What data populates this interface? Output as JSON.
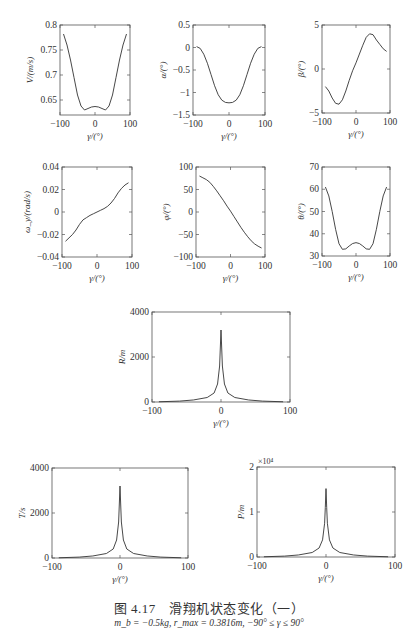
{
  "header": {
    "text": "|  |  |  ..."
  },
  "caption": {
    "title": "图 4.17　滑翔机状态变化（一）",
    "subtitle": "m_b = −0.5kg, r_max = 0.3816m, −90° ≤ γ ≤ 90°"
  },
  "chart_data": [
    {
      "id": "V",
      "type": "line",
      "title": "",
      "xlabel": "γ/(°)",
      "ylabel": "V/(m/s)",
      "xlim": [
        -100,
        100
      ],
      "ylim": [
        0.62,
        0.8
      ],
      "xticks": [
        "-100",
        "0",
        "100"
      ],
      "yticks": [
        "0.65",
        "0.7",
        "0.75",
        "0.8"
      ],
      "box": [
        60,
        25,
        130,
        115
      ],
      "x": [
        -90,
        -80,
        -70,
        -60,
        -50,
        -40,
        -30,
        -20,
        -10,
        0,
        10,
        20,
        30,
        40,
        50,
        60,
        70,
        80,
        90
      ],
      "y": [
        0.782,
        0.76,
        0.73,
        0.695,
        0.66,
        0.638,
        0.63,
        0.633,
        0.636,
        0.637,
        0.636,
        0.633,
        0.63,
        0.638,
        0.66,
        0.695,
        0.73,
        0.76,
        0.782
      ]
    },
    {
      "id": "alpha",
      "type": "line",
      "title": "",
      "xlabel": "γ/(°)",
      "ylabel": "α/(°)",
      "xlim": [
        -100,
        100
      ],
      "ylim": [
        -1.5,
        0.5
      ],
      "xticks": [
        "-100",
        "0",
        "100"
      ],
      "yticks": [
        "-1.5",
        "-1",
        "-0.5",
        "0",
        "0.5"
      ],
      "box": [
        193,
        25,
        265,
        115
      ],
      "x": [
        -90,
        -80,
        -70,
        -60,
        -50,
        -40,
        -30,
        -20,
        -10,
        0,
        10,
        20,
        30,
        40,
        50,
        60,
        70,
        80,
        90
      ],
      "y": [
        0.02,
        -0.02,
        -0.15,
        -0.35,
        -0.6,
        -0.85,
        -1.05,
        -1.17,
        -1.22,
        -1.23,
        -1.22,
        -1.17,
        -1.05,
        -0.85,
        -0.6,
        -0.35,
        -0.15,
        -0.02,
        0.02
      ]
    },
    {
      "id": "beta",
      "type": "line",
      "title": "",
      "xlabel": "γ/(°)",
      "ylabel": "β/(°)",
      "xlim": [
        -100,
        100
      ],
      "ylim": [
        -5,
        5
      ],
      "xticks": [
        "-100",
        "0",
        "100"
      ],
      "yticks": [
        "-5",
        "0",
        "5"
      ],
      "box": [
        322,
        25,
        390,
        113
      ],
      "x": [
        -90,
        -80,
        -70,
        -60,
        -50,
        -40,
        -30,
        -20,
        -10,
        0,
        10,
        20,
        30,
        40,
        50,
        60,
        70,
        80,
        90
      ],
      "y": [
        -2.0,
        -2.5,
        -3.3,
        -3.9,
        -4.0,
        -3.5,
        -2.5,
        -1.3,
        -0.2,
        0.7,
        1.7,
        2.7,
        3.6,
        4.0,
        3.9,
        3.3,
        2.8,
        2.3,
        2.0
      ]
    },
    {
      "id": "omega_y",
      "type": "line",
      "title": "",
      "xlabel": "γ/(°)",
      "ylabel": "ω_y/(rad/s)",
      "xlim": [
        -100,
        100
      ],
      "ylim": [
        -0.04,
        0.04
      ],
      "xticks": [
        "-100",
        "0",
        "100"
      ],
      "yticks": [
        "-0.04",
        "-0.02",
        "0",
        "0.02",
        "0.04"
      ],
      "box": [
        62,
        167,
        132,
        257
      ],
      "x": [
        -90,
        -80,
        -70,
        -60,
        -50,
        -40,
        -30,
        -20,
        -10,
        0,
        10,
        20,
        30,
        40,
        50,
        60,
        70,
        80,
        90
      ],
      "y": [
        -0.026,
        -0.023,
        -0.02,
        -0.016,
        -0.011,
        -0.007,
        -0.005,
        -0.003,
        -0.0015,
        0,
        0.0015,
        0.003,
        0.005,
        0.008,
        0.012,
        0.017,
        0.021,
        0.024,
        0.026
      ]
    },
    {
      "id": "phi",
      "type": "line",
      "title": "",
      "xlabel": "γ/(°)",
      "ylabel": "φ/(°)",
      "xlim": [
        -100,
        100
      ],
      "ylim": [
        -100,
        100
      ],
      "xticks": [
        "-100",
        "0",
        "100"
      ],
      "yticks": [
        "-100",
        "-50",
        "0",
        "50",
        "100"
      ],
      "box": [
        196,
        167,
        265,
        257
      ],
      "x": [
        -90,
        -80,
        -70,
        -60,
        -50,
        -40,
        -30,
        -20,
        -10,
        0,
        10,
        20,
        30,
        40,
        50,
        60,
        70,
        80,
        90
      ],
      "y": [
        80,
        76,
        72,
        66,
        57,
        47,
        36,
        25,
        13,
        2,
        -10,
        -22,
        -34,
        -45,
        -55,
        -64,
        -71,
        -76,
        -80
      ]
    },
    {
      "id": "theta",
      "type": "line",
      "title": "",
      "xlabel": "γ/(°)",
      "ylabel": "θ/(°)",
      "xlim": [
        -100,
        100
      ],
      "ylim": [
        30,
        70
      ],
      "xticks": [
        "-100",
        "0",
        "100"
      ],
      "yticks": [
        "30",
        "40",
        "50",
        "60",
        "70"
      ],
      "box": [
        322,
        167,
        390,
        256
      ],
      "x": [
        -90,
        -80,
        -70,
        -60,
        -50,
        -40,
        -30,
        -20,
        -10,
        0,
        10,
        20,
        30,
        40,
        50,
        60,
        70,
        80,
        90
      ],
      "y": [
        61,
        57,
        50,
        42,
        35.5,
        33,
        33.2,
        34.5,
        35.6,
        36,
        35.6,
        34.5,
        33.2,
        33,
        35.5,
        42,
        50,
        57,
        61
      ]
    },
    {
      "id": "R",
      "type": "line",
      "title": "",
      "xlabel": "γ/(°)",
      "ylabel": "R/m",
      "xlim": [
        -100,
        100
      ],
      "ylim": [
        0,
        4000
      ],
      "xticks": [
        "-100",
        "0",
        "100"
      ],
      "yticks": [
        "0",
        "2000",
        "4000"
      ],
      "box": [
        152,
        312,
        290,
        402
      ],
      "x": [
        -90,
        -60,
        -40,
        -20,
        -10,
        -5,
        -2,
        -1,
        0,
        1,
        2,
        5,
        10,
        20,
        40,
        60,
        90
      ],
      "y": [
        10,
        40,
        90,
        200,
        400,
        800,
        1600,
        2400,
        3200,
        2400,
        1600,
        800,
        400,
        200,
        90,
        40,
        10
      ]
    },
    {
      "id": "T",
      "type": "line",
      "title": "",
      "xlabel": "γ/(°)",
      "ylabel": "T/s",
      "xlim": [
        -100,
        100
      ],
      "ylim": [
        0,
        4000
      ],
      "xticks": [
        "-100",
        "0",
        "100"
      ],
      "yticks": [
        "0",
        "2000",
        "4000"
      ],
      "box": [
        52,
        468,
        188,
        558
      ],
      "x": [
        -90,
        -60,
        -40,
        -20,
        -10,
        -5,
        -2,
        -1,
        0,
        1,
        2,
        5,
        10,
        20,
        40,
        60,
        90
      ],
      "y": [
        10,
        40,
        90,
        200,
        400,
        800,
        1600,
        2400,
        3200,
        2400,
        1600,
        800,
        400,
        200,
        90,
        40,
        10
      ]
    },
    {
      "id": "P",
      "type": "line",
      "title": "",
      "xlabel": "γ/(°)",
      "ylabel": "P/m",
      "multiplier": "×10⁴",
      "xlim": [
        -100,
        100
      ],
      "ylim": [
        0,
        2
      ],
      "xticks": [
        "-100",
        "0",
        "100"
      ],
      "yticks": [
        "0",
        "1",
        "2"
      ],
      "box": [
        257,
        467,
        395,
        557
      ],
      "x": [
        -90,
        -60,
        -40,
        -20,
        -10,
        -5,
        -2,
        -1,
        0,
        1,
        2,
        5,
        10,
        20,
        40,
        60,
        90
      ],
      "y": [
        0.005,
        0.02,
        0.045,
        0.1,
        0.2,
        0.38,
        0.75,
        1.1,
        1.52,
        1.1,
        0.75,
        0.38,
        0.2,
        0.1,
        0.045,
        0.02,
        0.005
      ]
    }
  ]
}
